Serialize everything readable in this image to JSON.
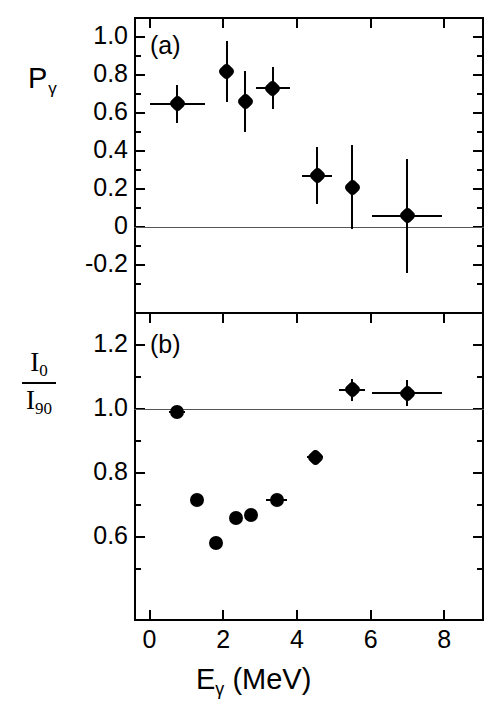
{
  "figure": {
    "xlabel_main": "E",
    "xlabel_sub": "γ",
    "xlabel_unit": "(MeV)",
    "panel_a_letter": "(a)",
    "panel_b_letter": "(b)",
    "ylabel_a_main": "P",
    "ylabel_a_sub": "γ",
    "ylabel_b_num_main": "I",
    "ylabel_b_num_sub": "0",
    "ylabel_b_den_main": "I",
    "ylabel_b_den_sub": "90",
    "axis_color": "#000000",
    "marker_color": "#000000",
    "refline_color": "#555555",
    "background": "#ffffff"
  },
  "chart_data": [
    {
      "type": "scatter",
      "panel": "(a)",
      "title": "",
      "xlabel": "Eγ (MeV)",
      "ylabel": "Pγ",
      "xlim": [
        -0.35,
        9.1
      ],
      "ylim": [
        -0.3,
        1.08
      ],
      "xticks": [
        0,
        2,
        4,
        6,
        8
      ],
      "xtick_labels": [
        "0",
        "2",
        "4",
        "6",
        "8"
      ],
      "xminor_ticks": [
        1,
        3,
        5,
        7
      ],
      "yticks": [
        1.0,
        0.8,
        0.6,
        0.4,
        0.2,
        0.0,
        -0.2
      ],
      "ytick_labels": [
        "1.0",
        "0.8",
        "0.6",
        "0.4",
        "0.2",
        "0",
        "-0.2"
      ],
      "grid": false,
      "reference_line_y": 0.0,
      "legend": "none",
      "points": [
        {
          "x": 0.75,
          "y": 0.65,
          "xerr": 0.75,
          "yerr": 0.1
        },
        {
          "x": 2.1,
          "y": 0.82,
          "xerr": 0.0,
          "yerr": 0.16
        },
        {
          "x": 2.6,
          "y": 0.66,
          "xerr": 0.0,
          "yerr": 0.16
        },
        {
          "x": 3.35,
          "y": 0.73,
          "xerr": 0.45,
          "yerr": 0.11
        },
        {
          "x": 4.55,
          "y": 0.27,
          "xerr": 0.4,
          "yerr": 0.15
        },
        {
          "x": 5.5,
          "y": 0.21,
          "xerr": 0.0,
          "yerr": 0.22
        },
        {
          "x": 7.0,
          "y": 0.06,
          "xerr": 0.95,
          "yerr": 0.3
        }
      ]
    },
    {
      "type": "scatter",
      "panel": "(b)",
      "title": "",
      "xlabel": "Eγ (MeV)",
      "ylabel": "I0/I90",
      "xlim": [
        -0.35,
        9.1
      ],
      "ylim": [
        0.5,
        1.3
      ],
      "xticks": [
        0,
        2,
        4,
        6,
        8
      ],
      "xtick_labels": [
        "0",
        "2",
        "4",
        "6",
        "8"
      ],
      "xminor_ticks": [
        1,
        3,
        5,
        7
      ],
      "yticks": [
        1.2,
        1.0,
        0.8,
        0.6
      ],
      "ytick_labels": [
        "1.2",
        "1.0",
        "0.8",
        "0.6"
      ],
      "yminor_ticks": [
        1.3,
        1.1,
        0.9,
        0.7,
        0.5
      ],
      "grid": false,
      "reference_line_y": 1.0,
      "legend": "none",
      "points": [
        {
          "x": 0.75,
          "y": 0.99,
          "xerr": 0.22,
          "yerr": 0.015
        },
        {
          "x": 1.3,
          "y": 0.715,
          "xerr": 0.0,
          "yerr": 0.01
        },
        {
          "x": 1.8,
          "y": 0.58,
          "xerr": 0.12,
          "yerr": 0.01
        },
        {
          "x": 2.35,
          "y": 0.66,
          "xerr": 0.0,
          "yerr": 0.01
        },
        {
          "x": 2.75,
          "y": 0.67,
          "xerr": 0.0,
          "yerr": 0.01
        },
        {
          "x": 3.45,
          "y": 0.715,
          "xerr": 0.28,
          "yerr": 0.01
        },
        {
          "x": 4.5,
          "y": 0.85,
          "xerr": 0.22,
          "yerr": 0.022
        },
        {
          "x": 5.5,
          "y": 1.06,
          "xerr": 0.35,
          "yerr": 0.035
        },
        {
          "x": 7.0,
          "y": 1.05,
          "xerr": 0.95,
          "yerr": 0.042
        }
      ]
    }
  ]
}
